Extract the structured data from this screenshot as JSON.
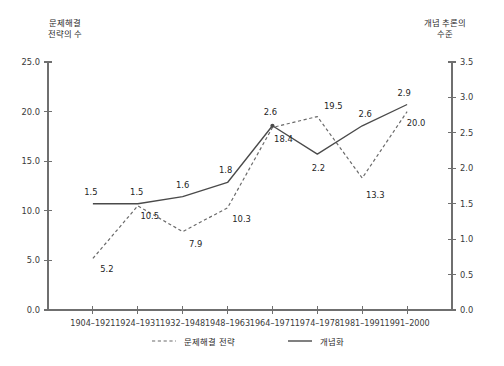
{
  "chart_data": {
    "type": "line",
    "title": "",
    "categories": [
      "1904–1921",
      "1924–1931",
      "1932–1948",
      "1948–1963",
      "1964–1971",
      "1974–1978",
      "1981–1991",
      "1991–2000"
    ],
    "xlabel": "",
    "ylabel": "문제해결\n전략의 수",
    "y2label": "개념 추론의\n수준",
    "ylim": [
      0.0,
      25.0
    ],
    "y2lim": [
      0.0,
      3.5
    ],
    "ytick_labels": [
      "0.0",
      "5.0",
      "10.0",
      "15.0",
      "20.0",
      "25.0"
    ],
    "ytick_values": [
      0.0,
      5.0,
      10.0,
      15.0,
      20.0,
      25.0
    ],
    "y2tick_labels": [
      "0.0",
      "0.5",
      "1.0",
      "1.5",
      "2.0",
      "2.5",
      "3.0",
      "3.5"
    ],
    "y2tick_values": [
      0.0,
      0.5,
      1.0,
      1.5,
      2.0,
      2.5,
      3.0,
      3.5
    ],
    "grid": false,
    "legend_position": "bottom",
    "series": [
      {
        "name": "문제해결 전략",
        "style": "dashed",
        "axis": "left",
        "color": "#6a6a6a",
        "values": [
          5.2,
          10.5,
          7.9,
          10.3,
          18.4,
          19.5,
          13.3,
          20.0
        ],
        "value_labels": [
          "5.2",
          "10.5",
          "7.9",
          "10.3",
          "18.4",
          "19.5",
          "13.3",
          "20.0"
        ]
      },
      {
        "name": "개념화",
        "style": "solid",
        "axis": "right",
        "color": "#4a4a4a",
        "values": [
          1.5,
          1.5,
          1.6,
          1.8,
          2.6,
          2.2,
          2.6,
          2.9
        ],
        "value_labels": [
          "1.5",
          "1.5",
          "1.6",
          "1.8",
          "2.6",
          "2.2",
          "2.6",
          "2.9"
        ]
      }
    ]
  },
  "axis_titles": {
    "left_line1": "문제해결",
    "left_line2": "전략의 수",
    "right_line1": "개념 추론의",
    "right_line2": "수준"
  },
  "legend": {
    "items": [
      {
        "label": "문제해결 전략",
        "style": "dashed"
      },
      {
        "label": "개념화",
        "style": "solid"
      }
    ]
  }
}
